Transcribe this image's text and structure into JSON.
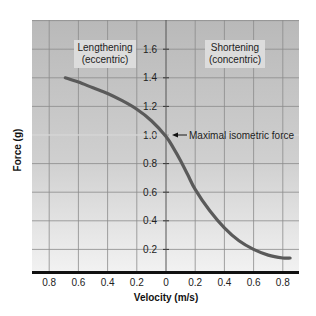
{
  "chart_data": {
    "type": "line",
    "title": "",
    "xlabel": "Velocity (m/s)",
    "ylabel": "Force (g)",
    "x_tick_labels": [
      "0.8",
      "0.6",
      "0.4",
      "0.2",
      "0",
      "0.2",
      "0.4",
      "0.6",
      "0.8"
    ],
    "x_tick_values": [
      -0.8,
      -0.6,
      -0.4,
      -0.2,
      0,
      0.2,
      0.4,
      0.6,
      0.8
    ],
    "y_tick_labels": [
      "0.2",
      "0.4",
      "0.6",
      "0.8",
      "1.0",
      "1.2",
      "1.4",
      "1.6"
    ],
    "y_tick_values": [
      0.2,
      0.4,
      0.6,
      0.8,
      1.0,
      1.2,
      1.4,
      1.6
    ],
    "xlim": [
      -0.92,
      0.92
    ],
    "ylim": [
      0.04,
      1.8
    ],
    "grid": true,
    "regions": [
      {
        "label_line1": "Lengthening",
        "label_line2": "(eccentric)",
        "side": "left"
      },
      {
        "label_line1": "Shortening",
        "label_line2": "(concentric)",
        "side": "right"
      }
    ],
    "annotation": {
      "text": "Maximal isometric force",
      "x": 0,
      "y": 1.0
    },
    "series": [
      {
        "name": "Force-velocity curve",
        "x": [
          -0.69,
          -0.6,
          -0.5,
          -0.4,
          -0.3,
          -0.2,
          -0.1,
          0,
          0.05,
          0.1,
          0.15,
          0.2,
          0.3,
          0.4,
          0.5,
          0.6,
          0.7,
          0.8,
          0.85
        ],
        "y": [
          1.4,
          1.37,
          1.33,
          1.29,
          1.24,
          1.18,
          1.1,
          0.99,
          0.91,
          0.82,
          0.72,
          0.62,
          0.47,
          0.35,
          0.26,
          0.2,
          0.16,
          0.14,
          0.14
        ]
      }
    ]
  },
  "labels": {
    "ylabel": "Force (g)",
    "xlabel": "Velocity (m/s)",
    "left_region_1": "Lengthening",
    "left_region_2": "(eccentric)",
    "right_region_1": "Shortening",
    "right_region_2": "(concentric)",
    "annotation": "Maximal isometric force"
  }
}
